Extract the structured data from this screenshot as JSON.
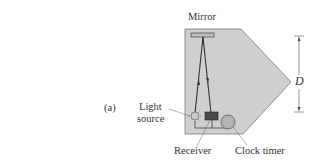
{
  "figure": {
    "panel_label": "(a)",
    "labels": {
      "mirror": "Mirror",
      "light_source_line1": "Light",
      "light_source_line2": "source",
      "receiver": "Receiver",
      "clock_timer": "Clock timer",
      "distance": "D"
    },
    "colors": {
      "housing_fill": "#cfcfcf",
      "housing_stroke": "#6b6b6b",
      "beam": "#3a3a3a",
      "receiver_fill": "#4a4a4a",
      "mirror_fill": "#bdbdbd"
    }
  }
}
